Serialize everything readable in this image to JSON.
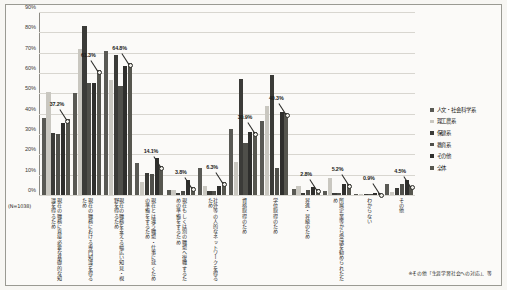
{
  "figure": {
    "n_note": "(N=1038)",
    "footnote": "※その他「生涯学習社会への対応」、等"
  },
  "legend": {
    "position": "right",
    "items": [
      {
        "label": "人文・社会科学系",
        "color": "#595954"
      },
      {
        "label": "理工農系",
        "color": "#c9c7c0"
      },
      {
        "label": "保健系",
        "color": "#3b3b38"
      },
      {
        "label": "教育系",
        "color": "#4f4f4a"
      },
      {
        "label": "その他",
        "color": "#2f2f2d"
      },
      {
        "label": "全体",
        "color": "#56564f"
      }
    ]
  },
  "chart_data": {
    "type": "bar",
    "title": "",
    "xlabel": "",
    "ylabel": "",
    "ylim": [
      0,
      90
    ],
    "grid": true,
    "ytick_labels": [
      "0%",
      "10%",
      "20%",
      "30%",
      "40%",
      "50%",
      "60%",
      "70%",
      "80%",
      "90%"
    ],
    "ytick_values": [
      0,
      10,
      20,
      30,
      40,
      50,
      60,
      70,
      80,
      90
    ],
    "categories": [
      "現在の職務に直接必要な基礎的な知識を得るため",
      "現在の職務における専門知識を得るため",
      "現在の職務を支える幅広い知見・視野を得るため",
      "現在とは違う職場・仕事に就くための準備をするため",
      "現在もしくは別の職場へ復職するための準備をするため",
      "社外等の人的なネットワークを得るため",
      "資格取得のため",
      "学位取得のため",
      "昇進・昇級のため",
      "所属企業等から受講を勧められたため",
      "わからない",
      "その他"
    ],
    "series": [
      {
        "name": "人文・社会科学系",
        "color": "#595954",
        "values": [
          37.8,
          50.3,
          70.8,
          15.8,
          2.6,
          13.4,
          32.5,
          36.2,
          3.0,
          2.0,
          0.5,
          5.2
        ]
      },
      {
        "name": "理工農系",
        "color": "#c9c7c0",
        "values": [
          50.6,
          72.0,
          56.7,
          6.6,
          2.4,
          4.3,
          16.0,
          44.0,
          4.2,
          8.5,
          0.3,
          1.5
        ]
      },
      {
        "name": "保健系",
        "color": "#3b3b38",
        "values": [
          30.4,
          83.0,
          68.9,
          10.6,
          0.9,
          2.0,
          57.0,
          59.0,
          1.0,
          1.2,
          0.2,
          3.4
        ]
      },
      {
        "name": "教育系",
        "color": "#4f4f4a",
        "values": [
          30.2,
          55.0,
          53.5,
          10.3,
          2.0,
          1.8,
          25.8,
          13.5,
          2.5,
          1.0,
          0.4,
          5.5
        ]
      },
      {
        "name": "その他",
        "color": "#2f2f2d",
        "values": [
          35.2,
          55.2,
          63.3,
          18.0,
          7.2,
          4.3,
          31.0,
          41.0,
          3.8,
          5.5,
          1.0,
          7.5
        ]
      },
      {
        "name": "全体",
        "color": "#56564f",
        "values": [
          37.2,
          61.3,
          64.8,
          14.1,
          3.8,
          6.3,
          30.9,
          40.3,
          2.8,
          5.2,
          0.9,
          4.5
        ]
      }
    ],
    "annotations": [
      {
        "text": "37.2%",
        "category_index": 0,
        "series": "全体",
        "value": 37.2
      },
      {
        "text": "61.3%",
        "category_index": 1,
        "series": "全体",
        "value": 61.3
      },
      {
        "text": "64.8%",
        "category_index": 2,
        "series": "全体",
        "value": 64.8
      },
      {
        "text": "14.1%",
        "category_index": 3,
        "series": "全体",
        "value": 14.1
      },
      {
        "text": "3.8%",
        "category_index": 4,
        "series": "全体",
        "value": 3.8
      },
      {
        "text": "6.3%",
        "category_index": 5,
        "series": "全体",
        "value": 6.3
      },
      {
        "text": "30.9%",
        "category_index": 6,
        "series": "全体",
        "value": 30.9
      },
      {
        "text": "40.3%",
        "category_index": 7,
        "series": "全体",
        "value": 40.3
      },
      {
        "text": "2.8%",
        "category_index": 8,
        "series": "全体",
        "value": 2.8
      },
      {
        "text": "5.2%",
        "category_index": 9,
        "series": "全体",
        "value": 5.2
      },
      {
        "text": "0.9%",
        "category_index": 10,
        "series": "全体",
        "value": 0.9
      },
      {
        "text": "4.5%",
        "category_index": 11,
        "series": "全体",
        "value": 4.5
      }
    ]
  }
}
